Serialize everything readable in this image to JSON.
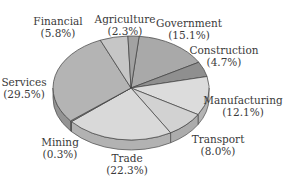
{
  "chart_data": {
    "type": "pie",
    "style": "3d-tilted",
    "title": "",
    "unit": "%",
    "slices": [
      {
        "label": "Government",
        "value": 15.1,
        "display": "(15.1%)",
        "color": "#a9a9a9"
      },
      {
        "label": "Construction",
        "value": 4.7,
        "display": "(4.7%)",
        "color": "#8f8f8f"
      },
      {
        "label": "Manufacturing",
        "value": 12.1,
        "display": "(12.1%)",
        "color": "#dcdcdc"
      },
      {
        "label": "Transport",
        "value": 8.0,
        "display": "(8.0%)",
        "color": "#d2d2d2"
      },
      {
        "label": "Trade",
        "value": 22.3,
        "display": "(22.3%)",
        "color": "#d9d9d9"
      },
      {
        "label": "Mining",
        "value": 0.3,
        "display": "(0.3%)",
        "color": "#9a9a9a"
      },
      {
        "label": "Services",
        "value": 29.5,
        "display": "(29.5%)",
        "color": "#b4b4b4"
      },
      {
        "label": "Financial",
        "value": 5.8,
        "display": "(5.8%)",
        "color": "#c6c6c6"
      },
      {
        "label": "Agriculture",
        "value": 2.3,
        "display": "(2.3%)",
        "color": "#a2a2a2"
      }
    ],
    "legend": "none (labels placed around pie)"
  },
  "labels": {
    "government": {
      "name": "Government",
      "pct": "(15.1%)"
    },
    "construction": {
      "name": "Construction",
      "pct": "(4.7%)"
    },
    "manufacturing": {
      "name": "Manufacturing",
      "pct": "(12.1%)"
    },
    "transport": {
      "name": "Transport",
      "pct": "(8.0%)"
    },
    "trade": {
      "name": "Trade",
      "pct": "(22.3%)"
    },
    "mining": {
      "name": "Mining",
      "pct": "(0.3%)"
    },
    "services": {
      "name": "Services",
      "pct": "(29.5%)"
    },
    "financial": {
      "name": "Financial",
      "pct": "(5.8%)"
    },
    "agriculture": {
      "name": "Agriculture",
      "pct": "(2.3%)"
    }
  }
}
